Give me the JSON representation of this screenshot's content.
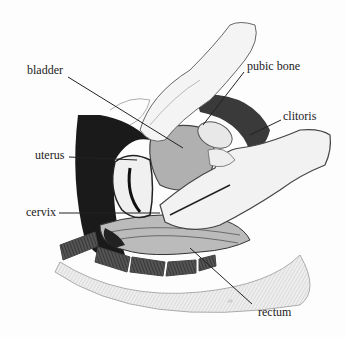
{
  "diagram": {
    "type": "anatomical-illustration",
    "labels": [
      {
        "id": "bladder",
        "text": "bladder",
        "x": 27,
        "y": 63,
        "line": [
          [
            68,
            77
          ],
          [
            183,
            148
          ]
        ]
      },
      {
        "id": "pubic-bone",
        "text": "pubic bone",
        "x": 247,
        "y": 59,
        "line": [
          [
            244,
            72
          ],
          [
            203,
            125
          ]
        ]
      },
      {
        "id": "clitoris",
        "text": "clitoris",
        "x": 283,
        "y": 109,
        "line": [
          [
            281,
            120
          ],
          [
            250,
            135
          ]
        ]
      },
      {
        "id": "uterus",
        "text": "uterus",
        "x": 35,
        "y": 148,
        "line": [
          [
            69,
            157
          ],
          [
            137,
            160
          ]
        ]
      },
      {
        "id": "cervix",
        "text": "cervix",
        "x": 26,
        "y": 205,
        "line": [
          [
            59,
            213
          ],
          [
            160,
            213
          ]
        ]
      },
      {
        "id": "rectum",
        "text": "rectum",
        "x": 258,
        "y": 305,
        "line": [
          [
            252,
            304
          ],
          [
            190,
            248
          ]
        ]
      }
    ]
  }
}
